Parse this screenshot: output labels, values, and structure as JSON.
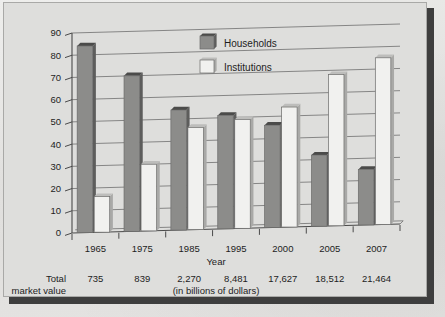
{
  "chart_data": {
    "type": "bar",
    "title": "",
    "subtitle": "",
    "xlabel": "Year",
    "ylabel": "",
    "ylim": [
      0,
      90
    ],
    "ytick_step": 10,
    "yticks": [
      "0",
      "10",
      "20",
      "30",
      "40",
      "50",
      "60",
      "70",
      "80",
      "90"
    ],
    "grid": true,
    "legend_position": "top-center",
    "categories": [
      "1965",
      "1975",
      "1985",
      "1995",
      "2000",
      "2005",
      "2007"
    ],
    "series": [
      {
        "name": "Households",
        "values": [
          84,
          70,
          54,
          51,
          46,
          32,
          25
        ]
      },
      {
        "name": "Institutions",
        "values": [
          16,
          30,
          46,
          49,
          54,
          68,
          75
        ]
      }
    ],
    "annotations": {
      "row_label_line1": "Total",
      "row_label_line2": "market value",
      "row_values": [
        "735",
        "839",
        "2,270",
        "8,481",
        "17,627",
        "18,512",
        "21,464"
      ],
      "units_note": "(in billions of dollars)"
    }
  },
  "legend": {
    "items": [
      {
        "label": "Households",
        "swatch": "dark-gray",
        "color": "#8c8c8a"
      },
      {
        "label": "Institutions",
        "swatch": "light-gray",
        "color": "#f1f1ef"
      }
    ]
  },
  "colors": {
    "households_bar": "#8c8c8a",
    "institutions_bar": "#f1f1ef",
    "plot_background": "#dededc",
    "page_background": "#e3e3e1",
    "frame_shadow": "#3e3e3e",
    "gridline": "#6f6f6f",
    "text": "#1d1d1d"
  }
}
